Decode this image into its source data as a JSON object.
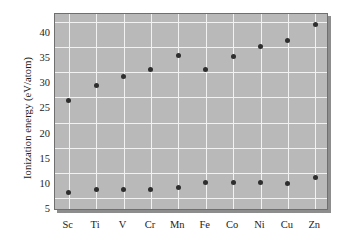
{
  "chart_data": {
    "type": "scatter",
    "title": "",
    "subtitle": "",
    "xlabel": "",
    "ylabel": "Ionization energy (eV/atom)",
    "categories": [
      "Sc",
      "Ti",
      "V",
      "Cr",
      "Mn",
      "Fe",
      "Co",
      "Ni",
      "Cu",
      "Zn"
    ],
    "ylim": [
      2.5,
      41.5
    ],
    "yticks": [
      5,
      10,
      15,
      20,
      25,
      30,
      35,
      40
    ],
    "ytick_labels": [
      "5",
      "10",
      "15",
      "20",
      "25",
      "30",
      "35",
      "40"
    ],
    "grid": true,
    "legend": "none",
    "series": [
      {
        "name": "second ionization energy",
        "values": [
          24.4,
          27.3,
          29.1,
          30.5,
          33.2,
          30.6,
          33.1,
          35.1,
          36.2,
          39.4
        ]
      },
      {
        "name": "first ionization energy",
        "values": [
          6.1,
          6.7,
          6.7,
          6.7,
          7.1,
          8.2,
          8.2,
          8.2,
          7.9,
          9.2
        ]
      }
    ],
    "marker_color": "#2e2e2e",
    "plot_background": "#b9b9b9",
    "gridline_color": "#f2f2f2",
    "frame_color": "#6f6f6f"
  }
}
